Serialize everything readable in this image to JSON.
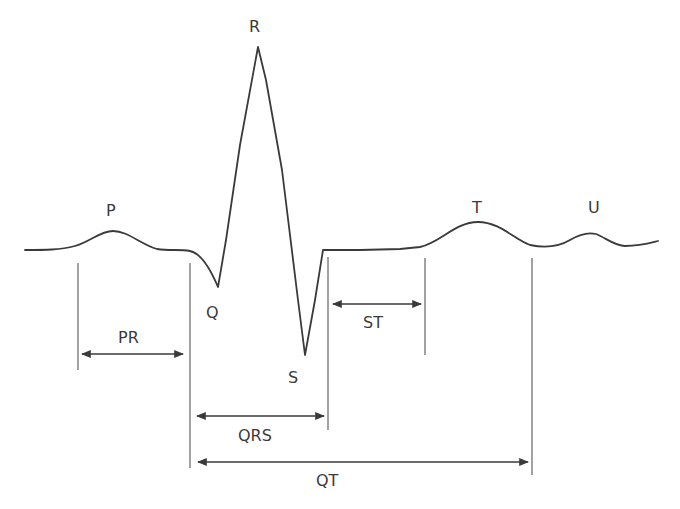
{
  "diagram": {
    "type": "ecg-waveform",
    "colors": {
      "line": "#3a3a3a",
      "background": "#ffffff"
    },
    "waves": {
      "P": "P",
      "Q": "Q",
      "R": "R",
      "S": "S",
      "T": "T",
      "U": "U"
    },
    "intervals": {
      "PR": "PR",
      "QRS": "QRS",
      "ST": "ST",
      "QT": "QT"
    }
  }
}
